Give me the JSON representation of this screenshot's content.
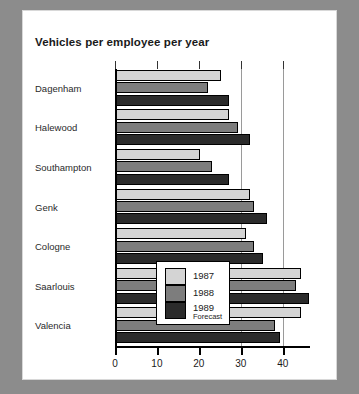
{
  "chart_data": {
    "type": "bar",
    "orientation": "horizontal",
    "title": "Vehicles per employee per year",
    "xlabel": "",
    "ylabel": "",
    "xlim": [
      0,
      46.5
    ],
    "xticks": [
      0,
      10,
      20,
      30,
      40
    ],
    "xtick_labels": [
      "0",
      "10",
      "20",
      "30",
      "40"
    ],
    "gridlines": [
      30,
      40
    ],
    "grid": true,
    "legend_position": "center-bottom-inside",
    "categories": [
      "Dagenham",
      "Halewood",
      "Southampton",
      "Genk",
      "Cologne",
      "Saarlouis",
      "Valencia"
    ],
    "series": [
      {
        "name": "1987",
        "color": "#d4d4d4",
        "values": [
          25,
          27,
          20,
          32,
          31,
          44,
          44
        ]
      },
      {
        "name": "1988",
        "color": "#7d7d7d",
        "values": [
          22,
          29,
          23,
          33,
          33,
          43,
          38
        ]
      },
      {
        "name": "1989",
        "sublabel": "Forecast",
        "color": "#2b2b2b",
        "values": [
          27,
          32,
          27,
          36,
          35,
          46,
          39
        ]
      }
    ]
  },
  "legend": {
    "items": [
      {
        "label": "1987",
        "sublabel": ""
      },
      {
        "label": "1988",
        "sublabel": ""
      },
      {
        "label": "1989",
        "sublabel": "Forecast"
      }
    ]
  }
}
